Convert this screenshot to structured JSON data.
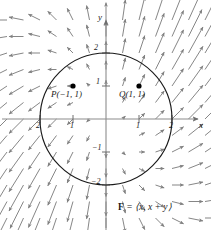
{
  "figure": {
    "title": "",
    "formula": "F = ⟨x, x + y⟩",
    "formula_bold_part": "F",
    "formula_rest": " = ⟨x, x + y⟩"
  },
  "axes": {
    "x_label": "x",
    "y_label": "y",
    "x_ticks": [
      {
        "value": -2,
        "label": "2",
        "sign": "−"
      },
      {
        "value": -1,
        "label": "1",
        "sign": "−"
      },
      {
        "value": 1,
        "label": "1",
        "sign": ""
      },
      {
        "value": 2,
        "label": "2",
        "sign": ""
      }
    ],
    "y_ticks": [
      {
        "value": 2,
        "label": "2",
        "sign": ""
      },
      {
        "value": 1,
        "label": "1",
        "sign": ""
      },
      {
        "value": -1,
        "label": "1",
        "sign": "−"
      },
      {
        "value": -2,
        "label": "2",
        "sign": "−"
      }
    ]
  },
  "points": [
    {
      "name": "P",
      "label": "P(−1, 1)",
      "x": -1,
      "y": 1
    },
    {
      "name": "Q",
      "label": "Q(1, 1)",
      "x": 1,
      "y": 1
    }
  ],
  "circle": {
    "center_x": 0,
    "center_y": 0,
    "radius": 2
  },
  "colors": {
    "arrow": "#808080",
    "axis": "#8c8c8c",
    "circle": "#1a1a1a",
    "text": "#1a1a1a",
    "point": "#000000",
    "background": "#ffffff"
  },
  "chart_data": {
    "type": "scatter",
    "title": "",
    "xlabel": "x",
    "ylabel": "y",
    "xlim": [
      -3.1,
      3.1
    ],
    "ylim": [
      -3.3,
      3.3
    ],
    "grid": false,
    "legend": null,
    "vector_field": {
      "expression": "F = ⟨x, x + y⟩",
      "fx": "x",
      "fy": "x + y",
      "sample_step": 0.5,
      "sample_range": [
        -3.0,
        3.0
      ]
    },
    "annotations": [
      {
        "text": "P(−1, 1)",
        "x": -1,
        "y": 1
      },
      {
        "text": "Q(1, 1)",
        "x": 1,
        "y": 1
      },
      {
        "text": "F = ⟨x, x + y⟩",
        "x": 1.6,
        "y": -2.9
      }
    ],
    "shapes": [
      {
        "type": "circle",
        "cx": 0,
        "cy": 0,
        "r": 2,
        "fill": "none",
        "stroke": "#1a1a1a"
      }
    ]
  }
}
